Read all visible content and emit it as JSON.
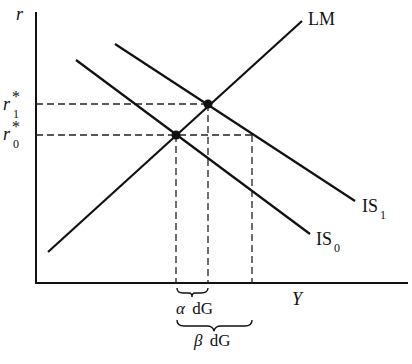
{
  "diagram": {
    "type": "IS-LM",
    "colors": {
      "ink": "#111111",
      "background": "#ffffff"
    },
    "axes": {
      "y_label": "r",
      "x_label": "Y"
    },
    "curves": [
      {
        "name": "LM",
        "label": "LM",
        "from": [
          48,
          252
        ],
        "to": [
          302,
          21
        ]
      },
      {
        "name": "IS0",
        "label": "IS",
        "subscript": "0",
        "from": [
          76,
          60
        ],
        "to": [
          310,
          234
        ]
      },
      {
        "name": "IS1",
        "label": "IS",
        "subscript": "1",
        "from": [
          115,
          44
        ],
        "to": [
          355,
          201
        ]
      }
    ],
    "equilibria": [
      {
        "name": "E0",
        "x": 176,
        "y": 135
      },
      {
        "name": "E1",
        "x": 208,
        "y": 104
      }
    ],
    "y_ticks": [
      {
        "label": "r",
        "superscript": "*",
        "subscript": "1"
      },
      {
        "label": "r",
        "superscript": "*",
        "subscript": "0"
      }
    ],
    "braces": [
      {
        "label_greek": "α",
        "label_text": "dG"
      },
      {
        "label_greek": "β",
        "label_text": "dG"
      }
    ]
  }
}
